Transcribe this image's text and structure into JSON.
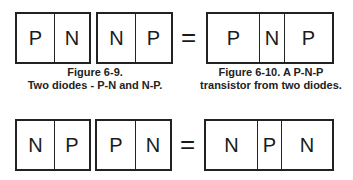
{
  "figure_6_9": {
    "diode1": [
      "P",
      "N"
    ],
    "diode2": [
      "N",
      "P"
    ],
    "caption_line1": "Figure 6-9.",
    "caption_line2": "Two diodes - P-N and N-P."
  },
  "figure_6_10": {
    "equals": "=",
    "transistor": [
      "P",
      "N",
      "P"
    ],
    "caption_line1": "Figure 6-10.  A P-N-P",
    "caption_line2": "transistor from two diodes."
  },
  "bottom_row": {
    "diode1": [
      "N",
      "P"
    ],
    "diode2": [
      "P",
      "N"
    ],
    "equals": "=",
    "transistor": [
      "N",
      "P",
      "N"
    ]
  }
}
